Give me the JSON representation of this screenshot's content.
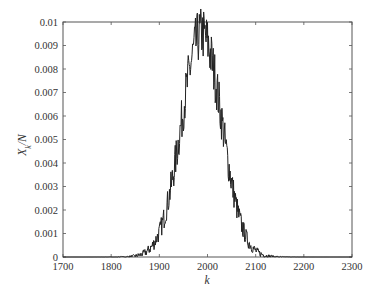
{
  "chart_data": {
    "type": "line",
    "title": "",
    "xlabel": "k",
    "ylabel": "X_k/N",
    "xlim": [
      1700,
      2300
    ],
    "ylim": [
      0,
      0.01
    ],
    "grid": false,
    "legend": null,
    "x_ticks": [
      1700,
      1800,
      1900,
      2000,
      2100,
      2200,
      2300
    ],
    "x_tick_labels": [
      "1700",
      "1800",
      "1900",
      "2000",
      "2100",
      "2200",
      "2300"
    ],
    "y_ticks": [
      0,
      0.001,
      0.002,
      0.003,
      0.004,
      0.005,
      0.006,
      0.007,
      0.008,
      0.009,
      0.01
    ],
    "y_tick_labels": [
      "0",
      "0.001",
      "0.002",
      "0.003",
      "0.004",
      "0.005",
      "0.006",
      "0.007",
      "0.008",
      "0.009",
      "0.01"
    ],
    "series": [
      {
        "name": "X_k/N",
        "color": "#222222",
        "shape": "noisy bell curve (approx. Gaussian)",
        "center": 1988,
        "sigma": 42,
        "peak": 0.0095,
        "x": [
          1800,
          1820,
          1840,
          1860,
          1880,
          1900,
          1920,
          1940,
          1960,
          1970,
          1980,
          1985,
          1990,
          2000,
          2010,
          2020,
          2040,
          2060,
          2080,
          2100,
          2120,
          2140,
          2160,
          2180
        ],
        "values": [
          4e-05,
          0.00013,
          0.0003,
          0.0008,
          0.0017,
          0.0031,
          0.0048,
          0.0067,
          0.0083,
          0.0089,
          0.0093,
          0.0095,
          0.0094,
          0.0089,
          0.0083,
          0.0073,
          0.0051,
          0.0032,
          0.0017,
          0.0008,
          0.0003,
          0.00011,
          3e-05,
          1e-05
        ]
      }
    ]
  },
  "axes": {
    "xlabel": "k",
    "ylabel_main": "X",
    "ylabel_sub": "k",
    "ylabel_rest": "/N"
  }
}
